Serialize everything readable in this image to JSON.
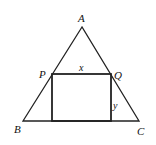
{
  "diagram": {
    "type": "geometry",
    "points": {
      "A": {
        "label": "A",
        "x": 82,
        "y": 27
      },
      "B": {
        "label": "B",
        "x": 23,
        "y": 121
      },
      "C": {
        "label": "C",
        "x": 139,
        "y": 121
      },
      "P": {
        "label": "P",
        "x": 52,
        "y": 74
      },
      "Q": {
        "label": "Q",
        "x": 111,
        "y": 74
      }
    },
    "rectangle": {
      "x": 52,
      "y": 74,
      "width": 59,
      "height": 47
    },
    "labels": {
      "A": "A",
      "B": "B",
      "C": "C",
      "P": "P",
      "Q": "Q",
      "x": "x",
      "y": "y"
    },
    "colors": {
      "stroke": "#222222",
      "background": "#ffffff"
    }
  }
}
